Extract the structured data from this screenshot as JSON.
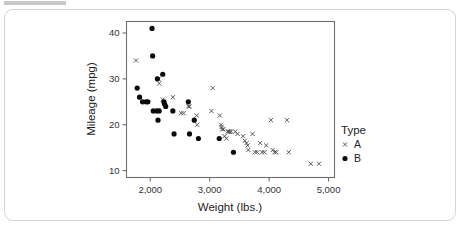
{
  "card": {
    "present": true
  },
  "chart_data": {
    "type": "scatter",
    "title": "",
    "xlabel": "Weight (lbs.)",
    "ylabel": "Mileage (mpg)",
    "xlim": [
      1600,
      5100
    ],
    "ylim": [
      8.5,
      42.5
    ],
    "xticks": [
      2000,
      3000,
      4000,
      5000
    ],
    "xticklabels": [
      "2,000",
      "3,000",
      "4,000",
      "5,000"
    ],
    "yticks": [
      10,
      20,
      30,
      40
    ],
    "yticklabels": [
      "10",
      "20",
      "30",
      "40"
    ],
    "grid": false,
    "legend": {
      "title": "Type",
      "position": "right",
      "entries": [
        {
          "label": "A",
          "marker": "x",
          "color": "#4a4a4a"
        },
        {
          "label": "B",
          "marker": "circle",
          "color": "#0b0b0b"
        }
      ]
    },
    "series": [
      {
        "name": "A",
        "marker": "x",
        "color": "#4a4a4a",
        "points": [
          [
            1760,
            34.0
          ],
          [
            2140,
            30.0
          ],
          [
            2150,
            29.0
          ],
          [
            2210,
            25.5
          ],
          [
            2230,
            25.0
          ],
          [
            2380,
            26.0
          ],
          [
            2520,
            22.5
          ],
          [
            2560,
            22.5
          ],
          [
            2640,
            24.0
          ],
          [
            2660,
            24.0
          ],
          [
            2780,
            22.0
          ],
          [
            2790,
            20.0
          ],
          [
            3050,
            28.0
          ],
          [
            3030,
            23.0
          ],
          [
            3170,
            22.0
          ],
          [
            3190,
            20.0
          ],
          [
            3200,
            19.5
          ],
          [
            3210,
            19.0
          ],
          [
            3230,
            19.0
          ],
          [
            3300,
            18.5
          ],
          [
            3320,
            18.5
          ],
          [
            3340,
            18.5
          ],
          [
            3360,
            18.5
          ],
          [
            3250,
            17.5
          ],
          [
            3280,
            17.0
          ],
          [
            3430,
            18.5
          ],
          [
            3470,
            18.0
          ],
          [
            3560,
            17.5
          ],
          [
            3590,
            16.5
          ],
          [
            3620,
            16.0
          ],
          [
            3640,
            15.5
          ],
          [
            3650,
            14.5
          ],
          [
            3720,
            18.0
          ],
          [
            3760,
            14.0
          ],
          [
            3800,
            14.0
          ],
          [
            3850,
            16.0
          ],
          [
            3880,
            14.0
          ],
          [
            3920,
            14.0
          ],
          [
            3950,
            15.5
          ],
          [
            4030,
            21.0
          ],
          [
            4060,
            14.5
          ],
          [
            4090,
            14.0
          ],
          [
            4120,
            14.0
          ],
          [
            4300,
            21.0
          ],
          [
            4330,
            14.0
          ],
          [
            4700,
            11.5
          ],
          [
            4840,
            11.5
          ]
        ]
      },
      {
        "name": "B",
        "marker": "circle",
        "color": "#0b0b0b",
        "points": [
          [
            2030,
            41.0
          ],
          [
            2040,
            35.0
          ],
          [
            2120,
            30.0
          ],
          [
            2210,
            31.0
          ],
          [
            1780,
            28.0
          ],
          [
            1820,
            26.0
          ],
          [
            1870,
            25.0
          ],
          [
            1930,
            25.0
          ],
          [
            1960,
            25.0
          ],
          [
            2230,
            25.0
          ],
          [
            2240,
            24.5
          ],
          [
            2260,
            24.0
          ],
          [
            2050,
            23.0
          ],
          [
            2110,
            23.0
          ],
          [
            2150,
            23.0
          ],
          [
            2380,
            23.0
          ],
          [
            2130,
            21.0
          ],
          [
            2640,
            25.0
          ],
          [
            2740,
            21.0
          ],
          [
            2400,
            18.0
          ],
          [
            2660,
            18.0
          ],
          [
            2810,
            17.0
          ],
          [
            3160,
            17.0
          ],
          [
            3400,
            14.0
          ]
        ]
      }
    ]
  }
}
